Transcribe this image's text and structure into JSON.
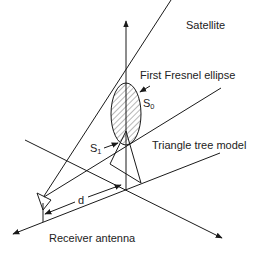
{
  "diagram": {
    "type": "geometry-illustration",
    "labels": {
      "satellite": "Satellite",
      "fresnel": "First Fresnel ellipse",
      "s0_main": "S",
      "s0_sub": "0",
      "s1_main": "S",
      "s1_sub": "1",
      "tree": "Triangle tree model",
      "distance": "d",
      "receiver": "Receiver antenna"
    },
    "colors": {
      "stroke": "#1a1a1a",
      "text": "#222222",
      "background": "#ffffff"
    }
  }
}
